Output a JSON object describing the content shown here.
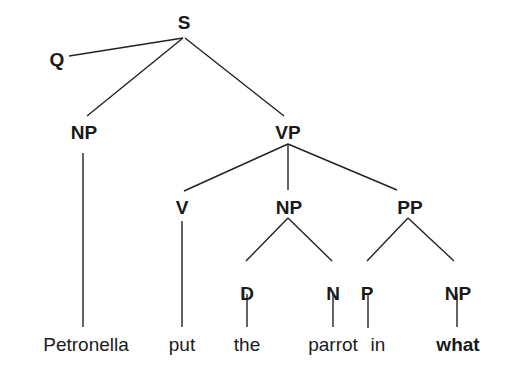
{
  "diagram": {
    "type": "syntax-tree",
    "nodes": [
      {
        "id": "S",
        "label": "S",
        "x": 184,
        "y": 22
      },
      {
        "id": "Q",
        "label": "Q",
        "x": 57,
        "y": 59
      },
      {
        "id": "NP1",
        "label": "NP",
        "x": 84,
        "y": 132
      },
      {
        "id": "VP",
        "label": "VP",
        "x": 288,
        "y": 132
      },
      {
        "id": "V",
        "label": "V",
        "x": 182,
        "y": 207
      },
      {
        "id": "NP2",
        "label": "NP",
        "x": 289,
        "y": 207
      },
      {
        "id": "PP",
        "label": "PP",
        "x": 410,
        "y": 207
      },
      {
        "id": "D",
        "label": "D",
        "x": 247,
        "y": 293
      },
      {
        "id": "N",
        "label": "N",
        "x": 333,
        "y": 293
      },
      {
        "id": "P",
        "label": "P",
        "x": 367,
        "y": 293
      },
      {
        "id": "NP3",
        "label": "NP",
        "x": 458,
        "y": 293
      }
    ],
    "words": [
      {
        "text": "Petronella",
        "x": 86,
        "y": 344,
        "bold": false
      },
      {
        "text": "put",
        "x": 182,
        "y": 344,
        "bold": false
      },
      {
        "text": "the",
        "x": 247,
        "y": 344,
        "bold": false
      },
      {
        "text": "parrot",
        "x": 333,
        "y": 344,
        "bold": false
      },
      {
        "text": "in",
        "x": 378,
        "y": 344,
        "bold": false
      },
      {
        "text": "what",
        "x": 458,
        "y": 344,
        "bold": true
      }
    ],
    "edges": [
      {
        "from": "S",
        "to": "Q",
        "x1": 183,
        "y1": 38,
        "x2": 69,
        "y2": 56
      },
      {
        "from": "S",
        "to": "NP1",
        "x1": 183,
        "y1": 38,
        "x2": 87,
        "y2": 116
      },
      {
        "from": "S",
        "to": "VP",
        "x1": 185,
        "y1": 38,
        "x2": 284,
        "y2": 116
      },
      {
        "from": "NP1",
        "to": "Petronella",
        "x1": 83,
        "y1": 153,
        "x2": 83,
        "y2": 327
      },
      {
        "from": "VP",
        "to": "V",
        "x1": 288,
        "y1": 144,
        "x2": 184,
        "y2": 191
      },
      {
        "from": "VP",
        "to": "NP2",
        "x1": 288,
        "y1": 144,
        "x2": 288,
        "y2": 190
      },
      {
        "from": "VP",
        "to": "PP",
        "x1": 288,
        "y1": 144,
        "x2": 397,
        "y2": 190
      },
      {
        "from": "V",
        "to": "put",
        "x1": 182,
        "y1": 221,
        "x2": 182,
        "y2": 327
      },
      {
        "from": "NP2",
        "to": "D",
        "x1": 288,
        "y1": 218,
        "x2": 246,
        "y2": 261
      },
      {
        "from": "NP2",
        "to": "N",
        "x1": 288,
        "y1": 218,
        "x2": 332,
        "y2": 261
      },
      {
        "from": "PP",
        "to": "P",
        "x1": 408,
        "y1": 218,
        "x2": 367,
        "y2": 261
      },
      {
        "from": "PP",
        "to": "NP3",
        "x1": 408,
        "y1": 218,
        "x2": 454,
        "y2": 261
      },
      {
        "from": "D",
        "to": "the",
        "x1": 247,
        "y1": 294,
        "x2": 247,
        "y2": 327
      },
      {
        "from": "N",
        "to": "parrot",
        "x1": 333,
        "y1": 294,
        "x2": 333,
        "y2": 327
      },
      {
        "from": "P",
        "to": "in",
        "x1": 368,
        "y1": 294,
        "x2": 368,
        "y2": 328
      },
      {
        "from": "NP3",
        "to": "what",
        "x1": 457,
        "y1": 294,
        "x2": 457,
        "y2": 327
      }
    ]
  }
}
